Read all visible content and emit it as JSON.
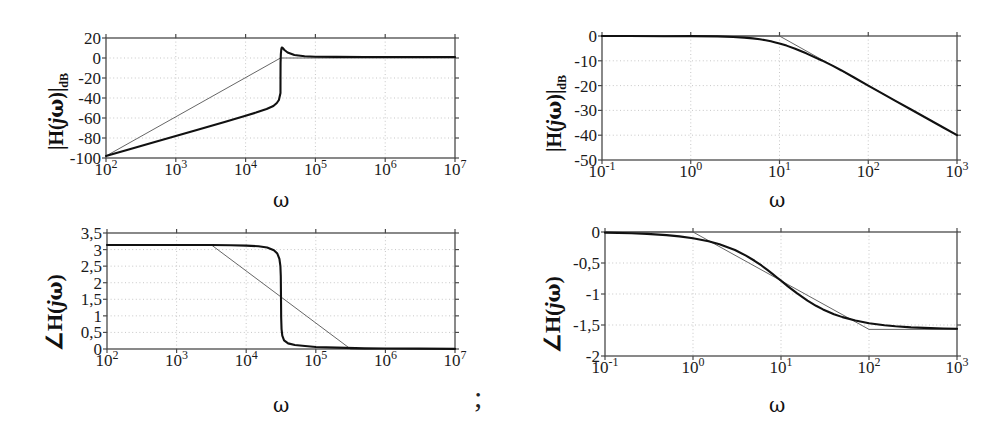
{
  "figure": {
    "background": "#ffffff",
    "ink": "#1a1a1a",
    "grid_color": "#b9b9b9",
    "axis_color": "#4a4a4a",
    "curve_color": "#111111",
    "asymptote_color": "#555555",
    "stray_mark": ";"
  },
  "panels": {
    "top_left": {
      "name": "magnitude-plot-1",
      "ylabel_main": "|H(",
      "ylabel_italic": "j",
      "ylabel_omega": "ω",
      "ylabel_close": ")|",
      "ylabel_sub": "dB",
      "xlabel": "ω",
      "yticks": [
        "20",
        "0",
        "-20",
        "-40",
        "-60",
        "-80",
        "-100"
      ],
      "xticks": [
        "10",
        "10",
        "10",
        "10",
        "10",
        "10"
      ],
      "xtick_exponents": [
        "2",
        "3",
        "4",
        "5",
        "6",
        "7"
      ]
    },
    "top_right": {
      "name": "magnitude-plot-2",
      "ylabel_main": "|H(",
      "ylabel_italic": "j",
      "ylabel_omega": "ω",
      "ylabel_close": ")|",
      "ylabel_sub": "dB",
      "xlabel": "ω",
      "yticks": [
        "0",
        "-10",
        "-20",
        "-30",
        "-40",
        "-50"
      ],
      "xticks": [
        "10",
        "10",
        "10",
        "10",
        "10"
      ],
      "xtick_exponents": [
        "-1",
        "0",
        "1",
        "2",
        "3"
      ]
    },
    "bottom_left": {
      "name": "phase-plot-1",
      "ylabel_angle": "∠",
      "ylabel_main": "H(",
      "ylabel_italic": "j",
      "ylabel_omega": "ω",
      "ylabel_close": ")",
      "xlabel": "ω",
      "yticks": [
        "3,5",
        "3",
        "2,5",
        "2",
        "1,5",
        "1",
        "0,5",
        "0"
      ],
      "xticks": [
        "10",
        "10",
        "10",
        "10",
        "10",
        "10"
      ],
      "xtick_exponents": [
        "2",
        "3",
        "4",
        "5",
        "6",
        "7"
      ]
    },
    "bottom_right": {
      "name": "phase-plot-2",
      "ylabel_angle": "∠",
      "ylabel_main": "H(",
      "ylabel_italic": "j",
      "ylabel_omega": "ω",
      "ylabel_close": ")",
      "xlabel": "ω",
      "yticks": [
        "0",
        "-0,5",
        "-1",
        "-1,5",
        "-2"
      ],
      "xticks": [
        "10",
        "10",
        "10",
        "10",
        "10"
      ],
      "xtick_exponents": [
        "-1",
        "0",
        "1",
        "2",
        "3"
      ]
    }
  },
  "chart_data": [
    {
      "id": "top_left",
      "type": "line",
      "title": "",
      "xlabel": "ω",
      "ylabel": "|H(jω)|_dB",
      "xscale": "log",
      "xlim": [
        100,
        10000000
      ],
      "ylim": [
        -100,
        20
      ],
      "ytick_values": [
        20,
        0,
        -20,
        -40,
        -60,
        -80,
        -100
      ],
      "xtick_values": [
        100,
        1000,
        10000,
        100000,
        1000000,
        10000000
      ],
      "grid": true,
      "legend": "none",
      "series": [
        {
          "name": "exact magnitude",
          "style": "thick",
          "points": [
            [
              100,
              -98.0
            ],
            [
              141,
              -95.1
            ],
            [
              200,
              -92.0
            ],
            [
              316,
              -88.0
            ],
            [
              500,
              -84.0
            ],
            [
              1000,
              -78.0
            ],
            [
              2000,
              -72.0
            ],
            [
              3160,
              -68.0
            ],
            [
              5000,
              -64.0
            ],
            [
              10000,
              -57.8
            ],
            [
              14100,
              -54.6
            ],
            [
              20000,
              -51.0
            ],
            [
              25000,
              -48.0
            ],
            [
              28000,
              -45.0
            ],
            [
              30000,
              -42.0
            ],
            [
              31600,
              -35.0
            ],
            [
              31623,
              -20.0
            ],
            [
              31700,
              -5.0
            ],
            [
              32000,
              4.0
            ],
            [
              32500,
              9.0
            ],
            [
              33000,
              10.5
            ],
            [
              34000,
              10.0
            ],
            [
              36000,
              8.0
            ],
            [
              40000,
              5.5
            ],
            [
              50000,
              3.0
            ],
            [
              70000,
              1.8
            ],
            [
              100000,
              1.3
            ],
            [
              200000,
              1.1
            ],
            [
              500000,
              1.0
            ],
            [
              1000000,
              1.0
            ],
            [
              3000000,
              1.0
            ],
            [
              10000000,
              1.0
            ]
          ]
        },
        {
          "name": "asymptotic approximation",
          "style": "thin",
          "points": [
            [
              100,
              -98.0
            ],
            [
              31623,
              0.0
            ],
            [
              10000000,
              0.0
            ]
          ]
        }
      ]
    },
    {
      "id": "top_right",
      "type": "line",
      "title": "",
      "xlabel": "ω",
      "ylabel": "|H(jω)|_dB",
      "xscale": "log",
      "xlim": [
        0.1,
        1000
      ],
      "ylim": [
        -50,
        0
      ],
      "ytick_values": [
        0,
        -10,
        -20,
        -30,
        -40,
        -50
      ],
      "xtick_values": [
        0.1,
        1,
        10,
        100,
        1000
      ],
      "grid": true,
      "legend": "none",
      "series": [
        {
          "name": "exact magnitude",
          "style": "thick",
          "points": [
            [
              0.1,
              -0.01
            ],
            [
              0.2,
              -0.02
            ],
            [
              0.5,
              -0.1
            ],
            [
              1.0,
              -0.04
            ],
            [
              2.0,
              -0.17
            ],
            [
              3.0,
              -0.38
            ],
            [
              4.0,
              -0.64
            ],
            [
              5.0,
              -0.97
            ],
            [
              6.0,
              -1.34
            ],
            [
              7.0,
              -1.74
            ],
            [
              8.0,
              -2.15
            ],
            [
              9.0,
              -2.58
            ],
            [
              10.0,
              -3.01
            ],
            [
              12.0,
              -3.88
            ],
            [
              15.0,
              -5.11
            ],
            [
              20.0,
              -6.99
            ],
            [
              30.0,
              -9.85
            ],
            [
              40.0,
              -12.06
            ],
            [
              50.0,
              -13.89
            ],
            [
              70.0,
              -16.83
            ],
            [
              100.0,
              -20.04
            ],
            [
              150.0,
              -23.53
            ],
            [
              200.0,
              -26.03
            ],
            [
              300.0,
              -29.54
            ],
            [
              500.0,
              -33.98
            ],
            [
              700.0,
              -36.9
            ],
            [
              1000.0,
              -40.0
            ]
          ]
        },
        {
          "name": "asymptotic approximation",
          "style": "thin",
          "points": [
            [
              0.1,
              0.0
            ],
            [
              10.0,
              0.0
            ],
            [
              1000.0,
              -40.0
            ]
          ]
        }
      ]
    },
    {
      "id": "bottom_left",
      "type": "line",
      "title": "",
      "xlabel": "ω",
      "ylabel": "∠H(jω)",
      "xscale": "log",
      "xlim": [
        100,
        10000000
      ],
      "ylim": [
        0,
        3.5
      ],
      "ytick_values": [
        3.5,
        3,
        2.5,
        2,
        1.5,
        1,
        0.5,
        0
      ],
      "xtick_values": [
        100,
        1000,
        10000,
        100000,
        1000000,
        10000000
      ],
      "grid": true,
      "legend": "none",
      "series": [
        {
          "name": "exact phase",
          "style": "thick",
          "points": [
            [
              100,
              3.14
            ],
            [
              316,
              3.14
            ],
            [
              1000,
              3.14
            ],
            [
              3160,
              3.14
            ],
            [
              6000,
              3.13
            ],
            [
              10000,
              3.12
            ],
            [
              15000,
              3.1
            ],
            [
              20000,
              3.06
            ],
            [
              25000,
              2.98
            ],
            [
              28000,
              2.88
            ],
            [
              30000,
              2.72
            ],
            [
              31000,
              2.5
            ],
            [
              31400,
              2.2
            ],
            [
              31623,
              1.57
            ],
            [
              31800,
              0.95
            ],
            [
              32200,
              0.6
            ],
            [
              33000,
              0.4
            ],
            [
              35000,
              0.26
            ],
            [
              40000,
              0.17
            ],
            [
              50000,
              0.12
            ],
            [
              70000,
              0.09
            ],
            [
              100000,
              0.06
            ],
            [
              200000,
              0.04
            ],
            [
              500000,
              0.02
            ],
            [
              1000000,
              0.015
            ],
            [
              3000000,
              0.01
            ],
            [
              10000000,
              0.005
            ]
          ]
        },
        {
          "name": "asymptotic approximation",
          "style": "thin",
          "points": [
            [
              100,
              3.14
            ],
            [
              3162,
              3.14
            ],
            [
              316200,
              0.0
            ],
            [
              10000000,
              0.0
            ]
          ]
        }
      ]
    },
    {
      "id": "bottom_right",
      "type": "line",
      "title": "",
      "xlabel": "ω",
      "ylabel": "∠H(jω)",
      "xscale": "log",
      "xlim": [
        0.1,
        1000
      ],
      "ylim": [
        -2,
        0
      ],
      "ytick_values": [
        0,
        -0.5,
        -1,
        -1.5,
        -2
      ],
      "xtick_values": [
        0.1,
        1,
        10,
        100,
        1000
      ],
      "grid": true,
      "legend": "none",
      "series": [
        {
          "name": "exact phase",
          "style": "thick",
          "points": [
            [
              0.1,
              -0.01
            ],
            [
              0.2,
              -0.02
            ],
            [
              0.3,
              -0.03
            ],
            [
              0.5,
              -0.05
            ],
            [
              0.7,
              -0.07
            ],
            [
              1.0,
              -0.1
            ],
            [
              1.5,
              -0.149
            ],
            [
              2.0,
              -0.197
            ],
            [
              3.0,
              -0.291
            ],
            [
              4.0,
              -0.381
            ],
            [
              5.0,
              -0.464
            ],
            [
              6.0,
              -0.54
            ],
            [
              7.0,
              -0.611
            ],
            [
              8.0,
              -0.675
            ],
            [
              9.0,
              -0.733
            ],
            [
              10.0,
              -0.785
            ],
            [
              12.0,
              -0.876
            ],
            [
              15.0,
              -0.983
            ],
            [
              20.0,
              -1.107
            ],
            [
              25.0,
              -1.19
            ],
            [
              30.0,
              -1.249
            ],
            [
              40.0,
              -1.326
            ],
            [
              50.0,
              -1.373
            ],
            [
              70.0,
              -1.428
            ],
            [
              100.0,
              -1.471
            ],
            [
              150.0,
              -1.504
            ],
            [
              200.0,
              -1.521
            ],
            [
              300.0,
              -1.538
            ],
            [
              500.0,
              -1.551
            ],
            [
              700.0,
              -1.557
            ],
            [
              1000.0,
              -1.561
            ]
          ]
        },
        {
          "name": "asymptotic approximation",
          "style": "thin",
          "points": [
            [
              0.1,
              0.0
            ],
            [
              1.0,
              0.0
            ],
            [
              100.0,
              -1.5708
            ],
            [
              1000.0,
              -1.5708
            ]
          ]
        }
      ]
    }
  ]
}
